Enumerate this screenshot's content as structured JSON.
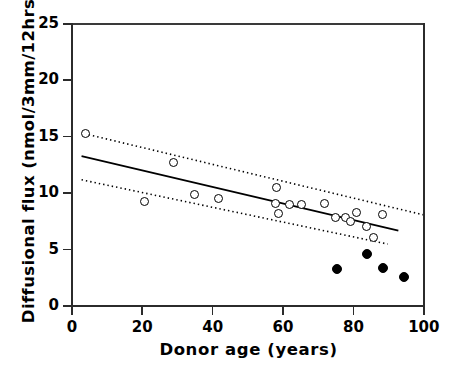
{
  "chart_data": {
    "type": "scatter",
    "title": "",
    "xlabel": "Donor age (years)",
    "ylabel": "Diffusional flux (nmol/3mm/12hrs)",
    "xlim": [
      0,
      100
    ],
    "ylim": [
      0,
      25
    ],
    "xticks": [
      0,
      20,
      40,
      60,
      80,
      100
    ],
    "yticks": [
      0,
      5,
      10,
      15,
      20,
      25
    ],
    "xtick_labels": [
      "0",
      "20",
      "40",
      "60",
      "80",
      "100"
    ],
    "ytick_labels": [
      "0",
      "5",
      "10",
      "15",
      "20",
      "25"
    ],
    "grid": false,
    "legend_position": "none",
    "series": [
      {
        "name": "open-circles",
        "marker": "open circle",
        "points": [
          [
            4.2,
            15.2
          ],
          [
            21.0,
            9.2
          ],
          [
            29.0,
            12.6
          ],
          [
            35.0,
            9.8
          ],
          [
            42.0,
            9.4
          ],
          [
            58.5,
            10.4
          ],
          [
            58.0,
            9.0
          ],
          [
            59.0,
            8.1
          ],
          [
            62.0,
            8.9
          ],
          [
            65.5,
            8.9
          ],
          [
            72.0,
            9.0
          ],
          [
            75.0,
            7.8
          ],
          [
            78.0,
            7.8
          ],
          [
            79.5,
            7.4
          ],
          [
            81.0,
            8.2
          ],
          [
            84.0,
            7.0
          ],
          [
            86.0,
            6.0
          ],
          [
            88.5,
            8.0
          ]
        ]
      },
      {
        "name": "filled-circles",
        "marker": "filled circle",
        "points": [
          [
            75.5,
            3.2
          ],
          [
            84.0,
            4.5
          ],
          [
            88.5,
            3.3
          ],
          [
            94.5,
            2.5
          ]
        ]
      }
    ],
    "regression_line": {
      "name": "least-squares fit",
      "style": "solid",
      "x_start": 3.0,
      "y_start": 13.2,
      "x_end": 93.0,
      "y_end": 6.6
    },
    "confidence_bands": [
      {
        "name": "upper confidence limit",
        "style": "dotted",
        "x_start": 5.0,
        "y_start": 15.1,
        "x_end": 100.0,
        "y_end": 8.0
      },
      {
        "name": "lower confidence limit",
        "style": "dotted",
        "x_start": 3.0,
        "y_start": 11.1,
        "x_end": 90.0,
        "y_end": 5.4
      }
    ]
  },
  "axis": {
    "x_title": "Donor age (years)",
    "y_title": "Diffusional flux (nmol/3mm/12hrs)"
  },
  "colors": {
    "axis": "#2b2b2b",
    "marker_stroke": "#000000",
    "marker_fill_open": "#ffffff",
    "marker_fill_closed": "#000000",
    "line": "#000000"
  }
}
